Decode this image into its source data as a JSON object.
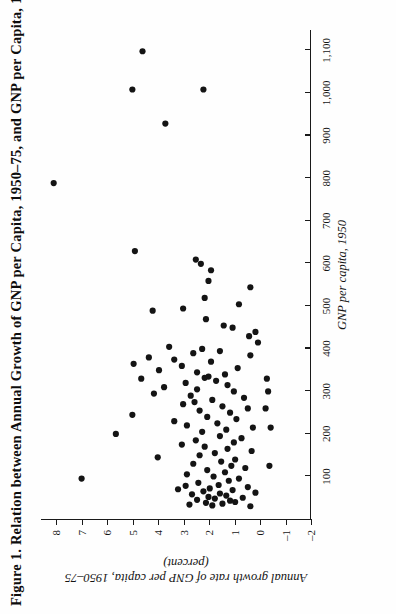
{
  "figure": {
    "title": "Figure 1.  Relation between Annual Growth of GNP per Capita, 1950–75, and GNP per Capita, 1950",
    "orientation": "rotated-90-ccw-on-page"
  },
  "chart_data": {
    "type": "scatter",
    "title": "Figure 1.  Relation between Annual Growth of GNP per Capita, 1950–75, and GNP per Capita, 1950",
    "xlabel": "GNP per capita, 1950",
    "ylabel": "Annual growth rate of GNP per capita, 1950–75 (percent)",
    "xlim": [
      0,
      1150
    ],
    "ylim": [
      -2,
      8.6
    ],
    "grid": false,
    "legend": null,
    "xticks": [
      100,
      200,
      300,
      400,
      500,
      600,
      700,
      800,
      900,
      1000,
      1100
    ],
    "xticklabels": [
      "100",
      "200",
      "300",
      "400",
      "500",
      "600",
      "700",
      "800",
      "900",
      "1,000",
      "1,100"
    ],
    "yticks": [
      -2,
      -1,
      0,
      1,
      2,
      3,
      4,
      5,
      6,
      7,
      8
    ],
    "yticklabels": [
      "–2",
      "–1",
      "0",
      "1",
      "2",
      "3",
      "4",
      "5",
      "6",
      "7",
      "8"
    ],
    "points": [
      [
        95,
        7.0
      ],
      [
        790,
        8.1
      ],
      [
        1010,
        5.0
      ],
      [
        1100,
        4.6
      ],
      [
        930,
        3.7
      ],
      [
        1010,
        2.2
      ],
      [
        630,
        4.9
      ],
      [
        610,
        2.5
      ],
      [
        600,
        2.3
      ],
      [
        585,
        1.9
      ],
      [
        560,
        2.0
      ],
      [
        545,
        0.35
      ],
      [
        520,
        2.15
      ],
      [
        505,
        0.8
      ],
      [
        495,
        3.0
      ],
      [
        490,
        4.2
      ],
      [
        470,
        2.1
      ],
      [
        455,
        1.4
      ],
      [
        450,
        1.05
      ],
      [
        440,
        0.15
      ],
      [
        430,
        0.4
      ],
      [
        415,
        0.05
      ],
      [
        405,
        3.55
      ],
      [
        400,
        2.25
      ],
      [
        395,
        1.55
      ],
      [
        390,
        2.6
      ],
      [
        385,
        0.35
      ],
      [
        380,
        4.35
      ],
      [
        375,
        3.35
      ],
      [
        370,
        1.9
      ],
      [
        365,
        4.95
      ],
      [
        360,
        3.05
      ],
      [
        355,
        0.85
      ],
      [
        350,
        3.95
      ],
      [
        345,
        2.45
      ],
      [
        340,
        1.35
      ],
      [
        335,
        2.0
      ],
      [
        332,
        2.15
      ],
      [
        330,
        4.65
      ],
      [
        325,
        1.7
      ],
      [
        320,
        2.9
      ],
      [
        315,
        1.25
      ],
      [
        310,
        3.75
      ],
      [
        305,
        2.45
      ],
      [
        300,
        1.0
      ],
      [
        295,
        4.15
      ],
      [
        290,
        2.7
      ],
      [
        285,
        0.6
      ],
      [
        280,
        1.85
      ],
      [
        275,
        2.55
      ],
      [
        270,
        3.0
      ],
      [
        265,
        1.45
      ],
      [
        260,
        0.45
      ],
      [
        255,
        2.35
      ],
      [
        250,
        1.15
      ],
      [
        245,
        5.0
      ],
      [
        240,
        2.05
      ],
      [
        235,
        0.9
      ],
      [
        230,
        3.35
      ],
      [
        225,
        1.65
      ],
      [
        220,
        2.85
      ],
      [
        215,
        0.25
      ],
      [
        210,
        1.3
      ],
      [
        205,
        2.25
      ],
      [
        200,
        5.65
      ],
      [
        195,
        1.55
      ],
      [
        190,
        0.7
      ],
      [
        185,
        2.5
      ],
      [
        180,
        1.0
      ],
      [
        175,
        3.05
      ],
      [
        170,
        2.15
      ],
      [
        165,
        1.25
      ],
      [
        160,
        0.3
      ],
      [
        155,
        1.75
      ],
      [
        150,
        2.35
      ],
      [
        145,
        4.0
      ],
      [
        140,
        0.95
      ],
      [
        135,
        1.5
      ],
      [
        130,
        2.6
      ],
      [
        125,
        1.1
      ],
      [
        120,
        0.55
      ],
      [
        115,
        2.05
      ],
      [
        110,
        1.35
      ],
      [
        105,
        2.85
      ],
      [
        100,
        1.8
      ],
      [
        95,
        0.8
      ],
      [
        90,
        1.2
      ],
      [
        85,
        2.4
      ],
      [
        80,
        1.6
      ],
      [
        78,
        2.9
      ],
      [
        75,
        0.45
      ],
      [
        72,
        1.95
      ],
      [
        70,
        3.2
      ],
      [
        68,
        1.05
      ],
      [
        65,
        2.2
      ],
      [
        62,
        0.15
      ],
      [
        60,
        1.55
      ],
      [
        58,
        2.65
      ],
      [
        55,
        1.3
      ],
      [
        52,
        2.0
      ],
      [
        50,
        0.65
      ],
      [
        48,
        1.75
      ],
      [
        45,
        2.45
      ],
      [
        43,
        1.15
      ],
      [
        40,
        0.95
      ],
      [
        38,
        2.1
      ],
      [
        36,
        1.45
      ],
      [
        34,
        2.75
      ],
      [
        32,
        1.85
      ],
      [
        30,
        0.35
      ],
      [
        125,
        -0.4
      ],
      [
        260,
        -0.25
      ],
      [
        300,
        -0.35
      ],
      [
        215,
        -0.45
      ],
      [
        330,
        -0.3
      ]
    ]
  }
}
